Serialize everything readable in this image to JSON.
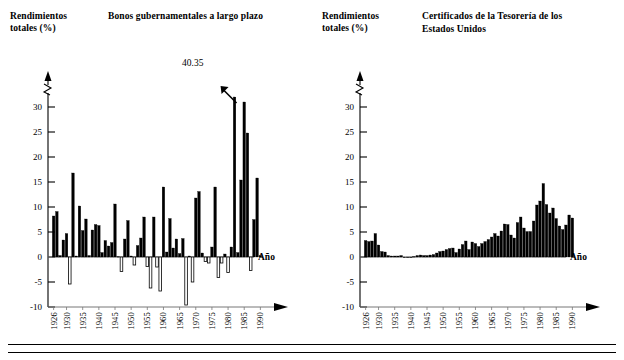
{
  "figure": {
    "axis_name": "Año",
    "y_axis_label_line1": "Rendimientos",
    "y_axis_label_line2": "totales (%)",
    "break_symbol": "axis-break"
  },
  "panels": [
    {
      "id": "bonos",
      "title_line1": "Bonos gubernamentales a largo plazo",
      "title_line2": "",
      "annotation": "40.35"
    },
    {
      "id": "certificados",
      "title_line1": "Certificados de la Tesorería de los",
      "title_line2": "Estados Unidos",
      "annotation": ""
    }
  ],
  "chart_data": [
    {
      "type": "bar",
      "id": "bonos-gubernamentales",
      "title": "Bonos gubernamentales a largo plazo",
      "xlabel": "Año",
      "ylabel": "Rendimientos totales (%)",
      "ylim": [
        -10,
        32
      ],
      "ytick_labels": [
        "30",
        "25",
        "20",
        "15",
        "10",
        "5",
        "0",
        "-5",
        "-10"
      ],
      "ytick_values": [
        30,
        25,
        20,
        15,
        10,
        5,
        0,
        -5,
        -10
      ],
      "xtick_labels": [
        "1926",
        "1930",
        "1935",
        "1940",
        "1945",
        "1950",
        "1955",
        "1960",
        "1965",
        "1970",
        "1975",
        "1980",
        "1985",
        "1990"
      ],
      "xtick_values": [
        1926,
        1930,
        1935,
        1940,
        1945,
        1950,
        1955,
        1960,
        1965,
        1970,
        1975,
        1980,
        1985,
        1990
      ],
      "grid": false,
      "legend": "none",
      "annotations": [
        {
          "text": "40.35",
          "x": 1982,
          "y": 32,
          "note": "bar clipped at top of axis, arrow points to 1982 bar"
        }
      ],
      "bar_fill_positive": "#000000",
      "bar_fill_negative": "#ffffff",
      "bar_edge": "#000000",
      "x": [
        1926,
        1927,
        1928,
        1929,
        1930,
        1931,
        1932,
        1933,
        1934,
        1935,
        1936,
        1937,
        1938,
        1939,
        1940,
        1941,
        1942,
        1943,
        1944,
        1945,
        1946,
        1947,
        1948,
        1949,
        1950,
        1951,
        1952,
        1953,
        1954,
        1955,
        1956,
        1957,
        1958,
        1959,
        1960,
        1961,
        1962,
        1963,
        1964,
        1965,
        1966,
        1967,
        1968,
        1969,
        1970,
        1971,
        1972,
        1973,
        1974,
        1975,
        1976,
        1977,
        1978,
        1979,
        1980,
        1981,
        1982,
        1983,
        1984,
        1985,
        1986,
        1987,
        1988,
        1989,
        1990
      ],
      "values": [
        8.2,
        9.1,
        0.3,
        3.4,
        4.7,
        -5.4,
        16.8,
        0.2,
        10.2,
        5.3,
        7.6,
        0.3,
        5.4,
        6.5,
        6.3,
        0.9,
        3.3,
        2.2,
        2.9,
        10.6,
        0.1,
        -2.9,
        3.6,
        7.3,
        0.2,
        -1.6,
        2.3,
        3.8,
        8.0,
        -1.9,
        -6.2,
        8.0,
        -2.0,
        -6.8,
        14.0,
        1.0,
        7.7,
        1.8,
        3.6,
        0.7,
        3.7,
        -9.6,
        0.2,
        -5.0,
        11.8,
        13.1,
        0.8,
        -0.9,
        -1.2,
        2.0,
        14.0,
        -4.1,
        -1.2,
        0.6,
        -3.1,
        2.0,
        40.35,
        0.9,
        15.4,
        31.0,
        24.8,
        -2.7,
        7.5,
        15.8,
        0.3
      ]
    },
    {
      "type": "bar",
      "id": "certificados-tesoreria",
      "title": "Certificados de la Tesorería de los Estados Unidos",
      "xlabel": "Año",
      "ylabel": "Rendimientos totales (%)",
      "ylim": [
        -10,
        32
      ],
      "ytick_labels": [
        "30",
        "25",
        "20",
        "15",
        "10",
        "5",
        "0",
        "-5",
        "-10"
      ],
      "ytick_values": [
        30,
        25,
        20,
        15,
        10,
        5,
        0,
        -5,
        -10
      ],
      "xtick_labels": [
        "1926",
        "1930",
        "1935",
        "1940",
        "1945",
        "1950",
        "1955",
        "1960",
        "1965",
        "1970",
        "1975",
        "1980",
        "1985",
        "1990"
      ],
      "xtick_values": [
        1926,
        1930,
        1935,
        1940,
        1945,
        1950,
        1955,
        1960,
        1965,
        1970,
        1975,
        1980,
        1985,
        1990
      ],
      "grid": false,
      "legend": "none",
      "annotations": [],
      "bar_fill_positive": "#000000",
      "bar_fill_negative": "#ffffff",
      "bar_edge": "#000000",
      "x": [
        1926,
        1927,
        1928,
        1929,
        1930,
        1931,
        1932,
        1933,
        1934,
        1935,
        1936,
        1937,
        1938,
        1939,
        1940,
        1941,
        1942,
        1943,
        1944,
        1945,
        1946,
        1947,
        1948,
        1949,
        1950,
        1951,
        1952,
        1953,
        1954,
        1955,
        1956,
        1957,
        1958,
        1959,
        1960,
        1961,
        1962,
        1963,
        1964,
        1965,
        1966,
        1967,
        1968,
        1969,
        1970,
        1971,
        1972,
        1973,
        1974,
        1975,
        1976,
        1977,
        1978,
        1979,
        1980,
        1981,
        1982,
        1983,
        1984,
        1985,
        1986,
        1987,
        1988,
        1989,
        1990
      ],
      "values": [
        3.3,
        3.1,
        3.2,
        4.7,
        2.4,
        1.1,
        1.0,
        0.3,
        0.2,
        0.2,
        0.2,
        0.3,
        0.0,
        0.0,
        0.0,
        0.1,
        0.3,
        0.4,
        0.3,
        0.3,
        0.4,
        0.5,
        0.8,
        1.1,
        1.2,
        1.5,
        1.7,
        1.8,
        0.9,
        1.6,
        2.5,
        3.2,
        1.5,
        3.0,
        2.7,
        2.1,
        2.7,
        3.1,
        3.5,
        4.0,
        4.7,
        4.2,
        5.2,
        6.6,
        6.5,
        4.4,
        3.8,
        6.9,
        8.0,
        5.8,
        5.1,
        5.1,
        7.2,
        10.4,
        11.2,
        14.7,
        10.5,
        8.8,
        9.8,
        7.7,
        6.2,
        5.5,
        6.4,
        8.4,
        7.8
      ]
    }
  ]
}
